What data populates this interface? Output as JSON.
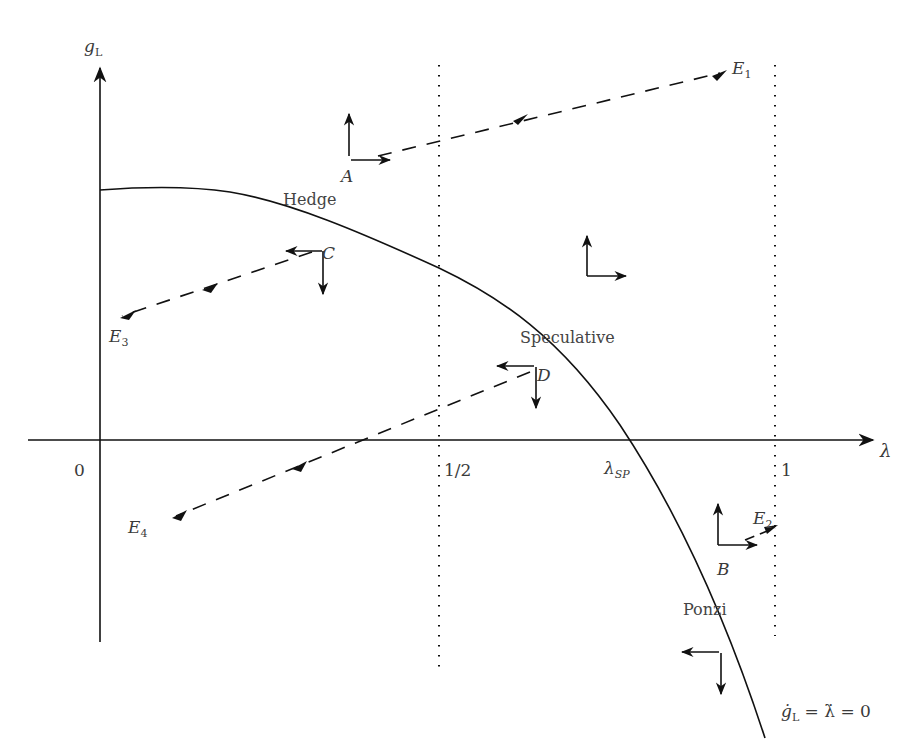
{
  "axes": {
    "y_label": "g",
    "y_label_sub": "L",
    "x_label": "λ",
    "origin_label": "0"
  },
  "ticks": {
    "half": "1/2",
    "lambda_sp": "λ",
    "lambda_sp_sub": "SP",
    "one": "1"
  },
  "regions": {
    "hedge": "Hedge",
    "speculative": "Speculative",
    "ponzi": "Ponzi"
  },
  "points": {
    "A": "A",
    "B": "B",
    "C": "C",
    "D": "D"
  },
  "equilibria": {
    "E1": {
      "base": "E",
      "sub": "1"
    },
    "E2": {
      "base": "E",
      "sub": "2"
    },
    "E3": {
      "base": "E",
      "sub": "3"
    },
    "E4": {
      "base": "E",
      "sub": "4"
    }
  },
  "curve_label": {
    "lhs": "ġ",
    "lhs_sub": "L",
    "rhs": " = λ̇ = 0"
  },
  "colors": {
    "ink": "#111111",
    "text": "#3a3a3a",
    "background": "#ffffff"
  }
}
